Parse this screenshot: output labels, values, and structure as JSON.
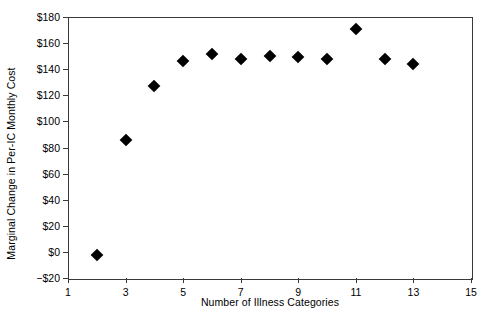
{
  "chart_data": {
    "type": "scatter",
    "title": "",
    "xlabel": "Number of Illness Categories",
    "ylabel": "Marginal Change in Per-IC Monthly Cost",
    "xlim": [
      1,
      15
    ],
    "ylim": [
      -20,
      180
    ],
    "grid": false,
    "legend": null,
    "x_ticks": [
      1,
      3,
      5,
      7,
      9,
      11,
      13,
      15
    ],
    "x_tick_labels": [
      "1",
      "3",
      "5",
      "7",
      "9",
      "11",
      "13",
      "15"
    ],
    "y_ticks": [
      -20,
      0,
      20,
      40,
      60,
      80,
      100,
      120,
      140,
      160,
      180
    ],
    "y_tick_labels": [
      "−$20",
      "$0",
      "$20",
      "$40",
      "$60",
      "$80",
      "$100",
      "$120",
      "$140",
      "$160",
      "$180"
    ],
    "marker": "diamond",
    "marker_color": "#000000",
    "x": [
      2,
      3,
      4,
      5,
      6,
      7,
      8,
      9,
      10,
      11,
      12,
      13
    ],
    "y": [
      -2,
      86,
      127,
      146,
      152,
      148,
      150,
      149,
      148,
      171,
      148,
      144
    ],
    "points": [
      {
        "x": 2,
        "y": -2
      },
      {
        "x": 3,
        "y": 86
      },
      {
        "x": 4,
        "y": 127
      },
      {
        "x": 5,
        "y": 146
      },
      {
        "x": 6,
        "y": 152
      },
      {
        "x": 7,
        "y": 148
      },
      {
        "x": 8,
        "y": 150
      },
      {
        "x": 9,
        "y": 149
      },
      {
        "x": 10,
        "y": 148
      },
      {
        "x": 11,
        "y": 171
      },
      {
        "x": 12,
        "y": 148
      },
      {
        "x": 13,
        "y": 144
      }
    ]
  },
  "figure": {
    "background_color": "#ffffff",
    "axis_color": "#3a3a3a",
    "text_color": "#000000"
  }
}
